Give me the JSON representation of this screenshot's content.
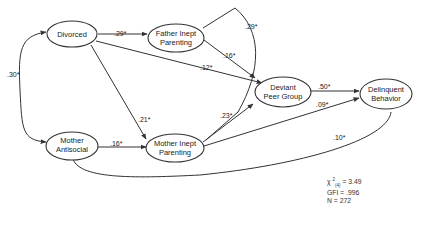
{
  "diagram": {
    "type": "path-model",
    "nodes": {
      "divorced": [
        "Divorced"
      ],
      "father_inept": [
        "Father Inept",
        "Parenting"
      ],
      "mother_antisocial": [
        "Mother",
        "Antisocial"
      ],
      "mother_inept": [
        "Mother Inept",
        "Parenting"
      ],
      "deviant_peer": [
        "Deviant",
        "Peer Group"
      ],
      "delinquent": [
        "Delinquent",
        "Behavior"
      ]
    },
    "paths": [
      {
        "from": "divorced",
        "to": "mother_antisocial",
        "coef": ".30*",
        "kind": "correlation"
      },
      {
        "from": "divorced",
        "to": "father_inept",
        "coef": ".29*",
        "kind": "direct"
      },
      {
        "from": "divorced",
        "to": "deviant_peer",
        "coef": ".12*",
        "kind": "direct"
      },
      {
        "from": "divorced",
        "to": "mother_inept",
        "coef": ".21*",
        "kind": "direct"
      },
      {
        "from": "father_inept",
        "to": "deviant_peer",
        "coef": ".16*",
        "kind": "direct"
      },
      {
        "from": "father_inept",
        "to": "mother_inept",
        "coef": ".29*",
        "kind": "correlation"
      },
      {
        "from": "mother_antisocial",
        "to": "mother_inept",
        "coef": ".16*",
        "kind": "direct"
      },
      {
        "from": "mother_inept",
        "to": "deviant_peer",
        "coef": ".23*",
        "kind": "direct"
      },
      {
        "from": "mother_inept",
        "to": "delinquent",
        "coef": ".09*",
        "kind": "direct"
      },
      {
        "from": "deviant_peer",
        "to": "delinquent",
        "coef": ".50*",
        "kind": "direct"
      },
      {
        "from": "mother_antisocial",
        "to": "delinquent",
        "coef": ".10*",
        "kind": "direct"
      }
    ],
    "fit": {
      "chi_symbol": "χ",
      "chi_sup": "2",
      "chi_sub": "(4)",
      "chi_value": "= 3.49",
      "gfi": "GFI = .996",
      "n": "N = 272"
    }
  }
}
